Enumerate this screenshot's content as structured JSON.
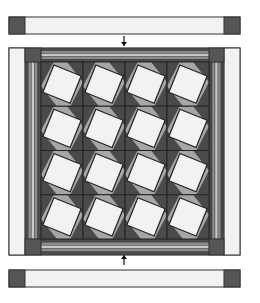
{
  "diagram": {
    "type": "quilt-assembly",
    "colors": {
      "background": "#ffffff",
      "outline": "#333333",
      "light": "#f2f2f2",
      "medium": "#a6a6a6",
      "dark": "#4a4a4a",
      "cornerstone": "#555555",
      "stripe_mid": "#8c8c8c",
      "stripe_light": "#c8c8c8",
      "arrow": "#111111"
    },
    "top_strip": {
      "x": 9,
      "y": 17,
      "w": 231,
      "h": 17,
      "cornerstone_w": 16
    },
    "bottom_strip": {
      "x": 9,
      "y": 270,
      "w": 231,
      "h": 17,
      "cornerstone_w": 16
    },
    "arrows": [
      {
        "name": "arrow-down-to-top-border",
        "x": 124,
        "y1": 36,
        "y2": 46,
        "direction": "down"
      },
      {
        "name": "arrow-up-to-bottom-border",
        "x": 124,
        "y1": 265,
        "y2": 255,
        "direction": "up"
      }
    ],
    "quilt": {
      "x": 9,
      "y": 48,
      "w": 231,
      "h": 207,
      "side_outer_border_w": 16,
      "inner_border_w": 16,
      "center": {
        "x": 41,
        "y": 62,
        "w": 168,
        "h": 177
      },
      "grid": {
        "rows": 4,
        "cols": 4
      },
      "block_rotation_deg": 22,
      "blocks": [
        [
          1,
          1,
          1,
          1
        ],
        [
          1,
          1,
          1,
          1
        ],
        [
          1,
          1,
          1,
          1
        ],
        [
          1,
          1,
          1,
          1
        ]
      ]
    }
  }
}
